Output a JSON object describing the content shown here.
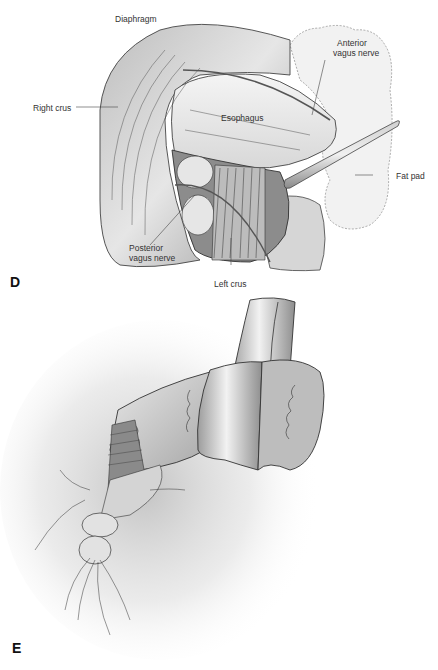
{
  "figure": {
    "panels": [
      {
        "id": "D",
        "letter": "D",
        "labels": {
          "diaphragm": "Diaphragm",
          "right_crus": "Right crus",
          "esophagus": "Esophagus",
          "anterior_vagus_line1": "Anterior",
          "anterior_vagus_line2": "vagus nerve",
          "fat_pad": "Fat pad",
          "posterior_vagus_line1": "Posterior",
          "posterior_vagus_line2": "vagus nerve",
          "left_crus": "Left crus"
        }
      },
      {
        "id": "E",
        "letter": "E",
        "labels": {}
      }
    ]
  }
}
